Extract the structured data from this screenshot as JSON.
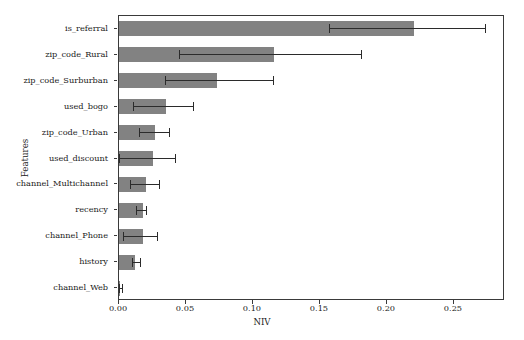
{
  "chart_data": {
    "type": "bar",
    "orientation": "horizontal",
    "title": "",
    "xlabel": "NIV",
    "ylabel": "Features",
    "xlim": [
      0.0,
      0.2881
    ],
    "grid": false,
    "legend": null,
    "xticks": [
      "0.00",
      "0.05",
      "0.10",
      "0.15",
      "0.20",
      "0.25"
    ],
    "xtick_values": [
      0.0,
      0.05,
      0.1,
      0.15,
      0.2,
      0.25
    ],
    "bar_color": "#828282",
    "error_color": "#2b2b2b",
    "categories": [
      "is_referral",
      "zip_code_Rural",
      "zip_code_Surburban",
      "used_bogo",
      "zip_code_Urban",
      "used_discount",
      "channel_Multichannel",
      "recency",
      "channel_Phone",
      "history",
      "channel_Web"
    ],
    "values": [
      0.22,
      0.1155,
      0.0732,
      0.0351,
      0.0269,
      0.0254,
      0.0201,
      0.0179,
      0.0179,
      0.0119,
      0.001
    ],
    "error_low": [
      0.1567,
      0.0448,
      0.0343,
      0.0104,
      0.0149,
      0.0,
      0.0082,
      0.0127,
      0.003,
      0.0097,
      0.0
    ],
    "error_high": [
      0.2731,
      0.1806,
      0.1149,
      0.0552,
      0.0373,
      0.0418,
      0.0299,
      0.0201,
      0.0284,
      0.0157,
      0.0022
    ]
  }
}
